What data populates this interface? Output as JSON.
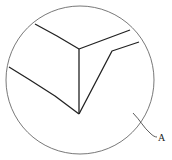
{
  "figure": {
    "type": "patent-detail-view",
    "width": 172,
    "height": 160,
    "background": "#ffffff",
    "stroke_color": "#222222",
    "circle_color": "#555555"
  },
  "detail_circle": {
    "cx": 80,
    "cy": 80,
    "r": 74
  },
  "lines": [
    {
      "name": "upper-left-edge",
      "points": "35,24 57,36 79,49"
    },
    {
      "name": "vertical-edge",
      "points": "79,49 79,114"
    },
    {
      "name": "upper-right-edge",
      "points": "79,49 130,30"
    },
    {
      "name": "left-curved-edge",
      "points": "9,67 30,80 55,96 79,114"
    },
    {
      "name": "lower-right-edge",
      "points": "79,114 112,51 139,42"
    }
  ],
  "leader": {
    "path": "M133,113 C140,120 144,128 150,133 C153,136 155,137 157,137"
  },
  "labels": [
    {
      "name": "reference-label-A",
      "text": "A",
      "x": 158,
      "y": 141
    }
  ]
}
